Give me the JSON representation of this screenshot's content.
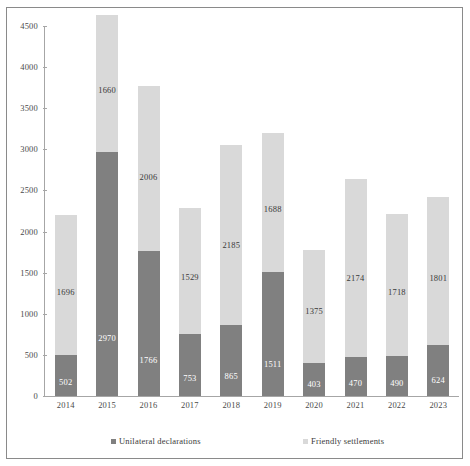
{
  "chart_data": {
    "type": "bar",
    "subtype": "stacked-vertical",
    "title": "",
    "xlabel": "",
    "ylabel": "",
    "ylim": [
      0,
      4500
    ],
    "yticks": [
      0,
      500,
      1000,
      1500,
      2000,
      2500,
      3000,
      3500,
      4000,
      4500
    ],
    "ytick_labels": [
      "0",
      "500",
      "1000",
      "1500",
      "2000",
      "2500",
      "3000",
      "3500",
      "4000",
      "4500"
    ],
    "grid": false,
    "legend_position": "bottom",
    "categories": [
      "2014",
      "2015",
      "2016",
      "2017",
      "2018",
      "2019",
      "2020",
      "2021",
      "2022",
      "2023"
    ],
    "series": [
      {
        "name": "Unilateral declarations",
        "color": "#808080",
        "values": [
          502,
          2970,
          1766,
          753,
          865,
          1511,
          403,
          470,
          490,
          624
        ]
      },
      {
        "name": "Friendly settlements",
        "color": "#d9d9d9",
        "values": [
          1696,
          1660,
          2006,
          1529,
          2185,
          1688,
          1375,
          2174,
          1718,
          1801
        ]
      }
    ],
    "totals": [
      2198,
      4630,
      3772,
      2282,
      3050,
      3199,
      1778,
      2644,
      2208,
      2425
    ]
  },
  "legend": {
    "items": [
      {
        "label": "Unilateral declarations",
        "color": "#808080"
      },
      {
        "label": "Friendly settlements",
        "color": "#d9d9d9"
      }
    ]
  },
  "colors": {
    "unilateral": "#808080",
    "friendly": "#d9d9d9",
    "axis": "#a6a6a6",
    "frame": "#8a8a8a",
    "background": "#ffffff"
  }
}
